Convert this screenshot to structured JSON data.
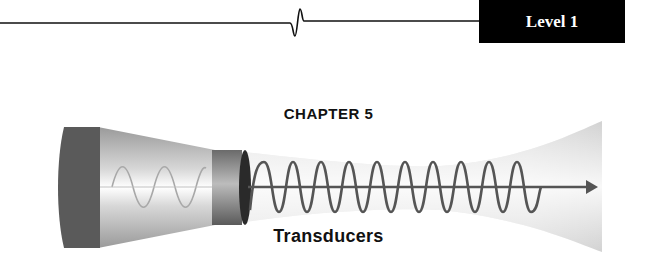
{
  "header": {
    "level_badge": "Level 1",
    "icon": "ecg-blip-icon"
  },
  "chapter": {
    "label": "CHAPTER 5",
    "title": "Transducers"
  },
  "illustration": {
    "icon": "transducer-beam-icon",
    "colors": {
      "cap": "#5a5a5a",
      "cone": "#c8c8c8",
      "beam": "#e2e2e2",
      "wave": "#555555",
      "badge_bg": "#000000"
    }
  }
}
